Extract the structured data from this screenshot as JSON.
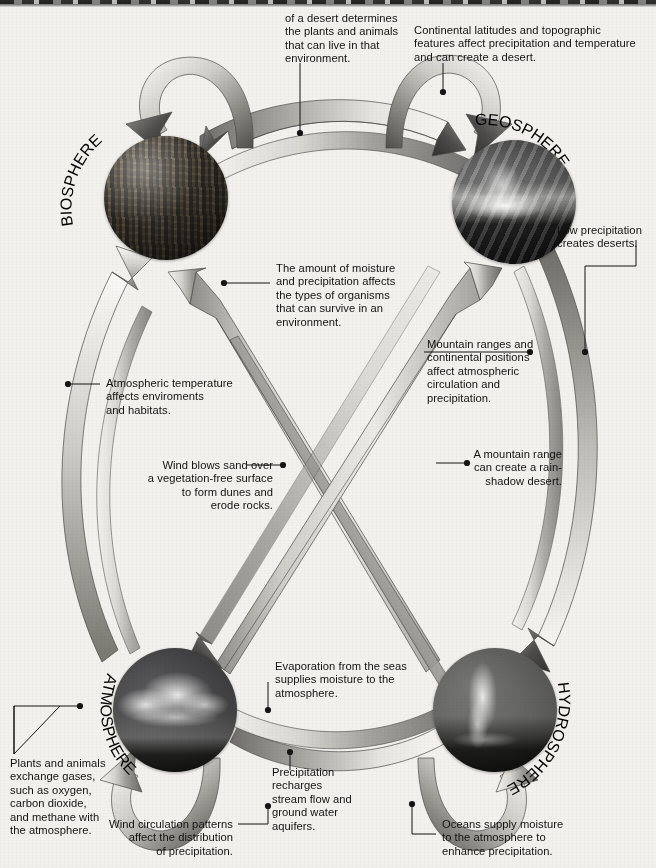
{
  "diagram": {
    "spheres": [
      {
        "id": "biosphere",
        "label": "BIOSPHERE",
        "image_desc": "forest-trees-photo"
      },
      {
        "id": "geosphere",
        "label": "GEOSPHERE",
        "image_desc": "mountain-peak-photo"
      },
      {
        "id": "atmosphere",
        "label": "ATMOSPHERE",
        "image_desc": "cumulus-cloud-photo"
      },
      {
        "id": "hydrosphere",
        "label": "HYDROSPHERE",
        "image_desc": "geyser-steam-photo"
      }
    ],
    "captions": {
      "top_left": "of a desert determines\nthe plants and animals\nthat can live in that\nenvironment.",
      "top_right": "Continental latitudes and topographic\nfeatures affect precipitation and temperature\nand can create a desert.",
      "geo_right": "Low precipitation\ncreates deserts.",
      "center_moisture": "The amount of moisture\nand precipitation affects\nthe types of organisms\nthat can survive in an\nenvironment.",
      "mountain_ranges": "Mountain ranges and\ncontinental positions\naffect atmospheric\ncirculation and\nprecipitation.",
      "atmos_temp": "Atmospheric temperature\naffects enviroments\nand habitats.",
      "wind_sand": "Wind blows sand over\na vegetation-free surface\nto form dunes and\nerode rocks.",
      "rain_shadow": "A mountain range\ncan create a rain-\nshadow desert.",
      "evaporation": "Evaporation from the seas\nsupplies moisture to the\natmosphere.",
      "plants_gases": "Plants and animals\nexchange gases,\nsuch as oxygen,\ncarbon dioxide,\nand methane with\nthe atmosphere.",
      "precip_recharge": "Precipitation\nrecharges\nstream flow and\nground water\naquifers.",
      "wind_circulation": "Wind circulation patterns\naffect the distribution\nof precipitation.",
      "oceans_supply": "Oceans supply moisture\nto the atmosphere to\nenhance precipitation."
    },
    "colors": {
      "background": "#f2f1ee",
      "arrow_light": "#e3e2de",
      "arrow_mid": "#b9b8b3",
      "arrow_dark": "#565655",
      "text": "#121212",
      "leader_line": "#1a1a1a"
    }
  }
}
